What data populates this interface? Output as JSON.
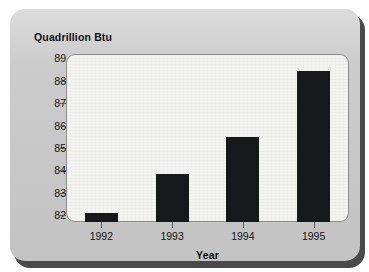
{
  "chart_data": {
    "type": "bar",
    "title": "",
    "subtitle": "",
    "xlabel": "Year",
    "ylabel": "Quadrillion Btu",
    "categories": [
      "1992",
      "1993",
      "1994",
      "1995"
    ],
    "values": [
      82.1,
      83.85,
      85.5,
      88.45
    ],
    "series": [
      {
        "name": "Energy consumption",
        "values": [
          82.1,
          83.85,
          85.5,
          88.45
        ]
      }
    ],
    "ytick_labels": [
      "89",
      "88",
      "87",
      "86",
      "85",
      "84",
      "83",
      "82"
    ],
    "ytick_values": [
      89,
      88,
      87,
      86,
      85,
      84,
      83,
      82
    ],
    "ylim": [
      81.7,
      89.2
    ],
    "xlim_categories": 4,
    "grid": false,
    "legend": false,
    "legend_position": "none",
    "bar_color": "#17181a",
    "plot_background": "#f3f3f2",
    "figure_background": "#c9c9c9",
    "axis_color": "#5c5c5c",
    "text_color": "#131313"
  },
  "figure": {
    "y_axis_title": "Quadrillion Btu",
    "x_axis_title": "Year"
  }
}
